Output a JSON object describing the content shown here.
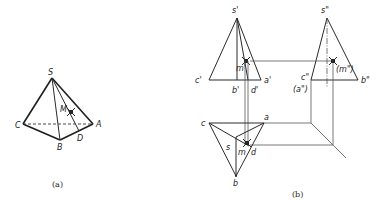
{
  "figure_a": {
    "caption": "(a)",
    "labels": {
      "S": "S",
      "M": "M",
      "C": "C",
      "A": "A",
      "B": "B",
      "D": "D"
    }
  },
  "figure_b": {
    "caption": "(b)",
    "front_view": {
      "s": "s'",
      "m": "m'",
      "c": "c'",
      "a": "a'",
      "b": "b'",
      "d": "d'"
    },
    "side_view": {
      "s": "s\"",
      "m": "(m\")",
      "c": "c\"",
      "a": "(a\")",
      "b": "b\""
    },
    "top_view": {
      "c": "c",
      "a": "a",
      "s": "s",
      "m": "m",
      "d": "d",
      "b": "b"
    }
  }
}
